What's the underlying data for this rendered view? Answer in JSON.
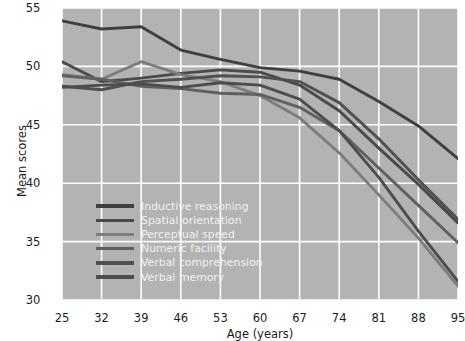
{
  "chart_data": {
    "type": "line",
    "title": "",
    "xlabel": "Age (years)",
    "ylabel": "Mean scores",
    "x": [
      25,
      32,
      39,
      46,
      53,
      60,
      67,
      74,
      81,
      88,
      95
    ],
    "xticks": [
      "25",
      "32",
      "39",
      "46",
      "53",
      "60",
      "67",
      "74",
      "81",
      "88",
      "95"
    ],
    "yticks": [
      "30",
      "35",
      "40",
      "45",
      "50",
      "55"
    ],
    "xlim": [
      25,
      95
    ],
    "ylim": [
      30,
      55
    ],
    "grid": true,
    "legend_position": "lower-left-inside",
    "plot_background": "#b3b3b3",
    "grid_color": "#ffffff",
    "series": [
      {
        "name": "Inductive reasoning",
        "color": "#3f3f3f",
        "values": [
          53.9,
          53.2,
          53.4,
          51.4,
          50.6,
          49.9,
          49.6,
          48.9,
          47.0,
          44.9,
          42.1
        ]
      },
      {
        "name": "Spatial orientation",
        "color": "#4a4a4a",
        "values": [
          50.4,
          48.7,
          49.0,
          49.4,
          49.7,
          49.5,
          48.4,
          46.2,
          43.0,
          39.9,
          36.6
        ]
      },
      {
        "name": "Perceptual speed",
        "color": "#7d7d7d",
        "values": [
          49.3,
          48.9,
          50.4,
          49.3,
          48.7,
          47.5,
          45.6,
          42.6,
          39.0,
          35.3,
          31.2
        ]
      },
      {
        "name": "Numeric facility",
        "color": "#606060",
        "values": [
          49.2,
          48.9,
          48.3,
          48.1,
          47.7,
          47.6,
          46.5,
          44.5,
          41.3,
          38.1,
          34.9
        ]
      },
      {
        "name": "Verbal comprehension",
        "color": "#505050",
        "values": [
          48.3,
          48.0,
          48.7,
          48.9,
          49.2,
          49.1,
          48.7,
          46.9,
          43.8,
          40.3,
          36.9
        ]
      },
      {
        "name": "Verbal memory",
        "color": "#4d4d4d",
        "values": [
          48.2,
          48.4,
          48.5,
          48.2,
          48.6,
          48.4,
          47.2,
          44.5,
          40.5,
          35.9,
          31.6
        ]
      }
    ]
  }
}
